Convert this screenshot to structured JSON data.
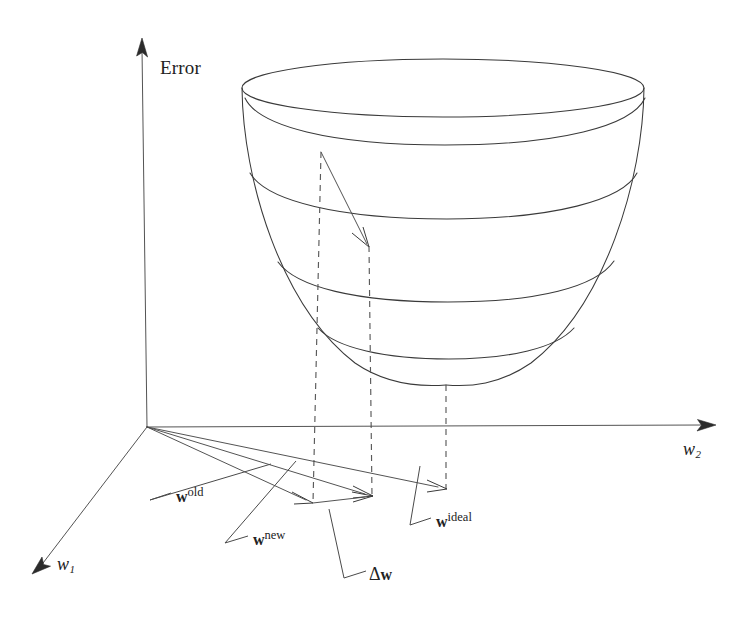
{
  "figure": {
    "background_color": "#ffffff",
    "line_color": "#3a3a3a",
    "dashed_line_color": "#5a5a5a",
    "text_color": "#222222"
  },
  "axes": {
    "vertical": {
      "name": "error-axis",
      "label": "Error",
      "label_x": 160,
      "label_y": 58,
      "origin": [
        147,
        427
      ],
      "tip": [
        142,
        38
      ]
    },
    "depth": {
      "name": "w1-axis",
      "label_base": "w",
      "label_sub": "1",
      "label_x": 57,
      "label_y": 565,
      "origin": [
        147,
        427
      ],
      "tip": [
        33,
        573
      ]
    },
    "horizontal": {
      "name": "w2-axis",
      "label_base": "w",
      "label_sub": "2",
      "label_x": 683,
      "label_y": 440,
      "origin": [
        147,
        427
      ],
      "tip": [
        716,
        425
      ]
    }
  },
  "surface": {
    "name": "error-paraboloid-bowl",
    "rim_center": [
      443,
      88
    ],
    "rim_rx": 201,
    "rim_ry": 29,
    "vertex": [
      446,
      385
    ],
    "contour_count": 4,
    "description": "Parabolic error surface drawn as a bowl with four horizontal contour rings"
  },
  "vectors": [
    {
      "id": "w-old",
      "label_bold": "w",
      "label_sup": "old",
      "label_x": 176,
      "label_y": 488,
      "from": [
        147,
        427
      ],
      "to": [
        312,
        502
      ],
      "leader_from": [
        171,
        493
      ],
      "leader_corner": [
        150,
        500
      ],
      "leader_to": [
        271,
        464
      ]
    },
    {
      "id": "w-new",
      "label_bold": "w",
      "label_sup": "new",
      "label_x": 253,
      "label_y": 531,
      "from": [
        147,
        427
      ],
      "to": [
        372,
        495
      ],
      "leader_from": [
        248,
        536
      ],
      "leader_corner": [
        225,
        543
      ],
      "leader_to": [
        296,
        461
      ]
    },
    {
      "id": "delta-w",
      "label_symbol": "Δ",
      "label_bold": "w",
      "label_x": 369,
      "label_y": 566,
      "from": [
        312,
        502
      ],
      "to": [
        372,
        495
      ],
      "leader_from": [
        366,
        571
      ],
      "leader_corner": [
        344,
        578
      ],
      "leader_to": [
        329,
        509
      ]
    },
    {
      "id": "w-ideal",
      "label_bold": "w",
      "label_sup": "ideal",
      "label_x": 436,
      "label_y": 513,
      "from": [
        147,
        427
      ],
      "to": [
        446,
        488
      ],
      "leader_from": [
        431,
        518
      ],
      "leader_corner": [
        410,
        525
      ],
      "leader_to": [
        420,
        466
      ]
    }
  ],
  "gradient_arrow": {
    "name": "gradient-descent-arrow",
    "from": [
      321,
      152
    ],
    "to": [
      369,
      247
    ],
    "description": "Arrow on the error surface from the old weight point down toward lower error"
  },
  "dashed_projections": [
    {
      "id": "proj-w-old",
      "x_top": 321,
      "y_top": 152,
      "x_bottom": 312,
      "y_bottom": 502
    },
    {
      "id": "proj-w-new",
      "x_top": 369,
      "y_top": 247,
      "x_bottom": 372,
      "y_bottom": 495
    },
    {
      "id": "proj-w-ideal",
      "x_top": 446,
      "y_top": 385,
      "x_bottom": 446,
      "y_bottom": 488
    }
  ]
}
